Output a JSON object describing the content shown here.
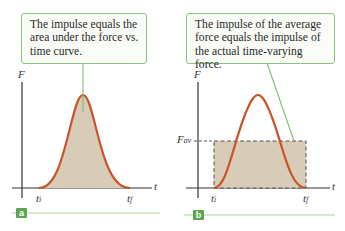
{
  "panels": [
    {
      "id": "a",
      "tag": "a",
      "callout": "The impulse equals the area under the force vs. time curve.",
      "y_axis_label": "F",
      "x_axis_label": "t",
      "t_initial_label": "t",
      "t_initial_sub": "i",
      "t_final_label": "t",
      "t_final_sub": "f"
    },
    {
      "id": "b",
      "tag": "b",
      "callout": "The impulse of the average force equals the impulse of the actual time-varying force.",
      "y_axis_label": "F",
      "x_axis_label": "t",
      "avg_label": "F",
      "avg_sub": "av",
      "t_initial_label": "t",
      "t_initial_sub": "i",
      "t_final_label": "t",
      "t_final_sub": "f"
    }
  ],
  "colors": {
    "curve": "#c8552a",
    "fill": "#d8cbb8",
    "callout_border": "#8cc47c",
    "tag_bg": "#5aa64e",
    "axis": "#333333"
  }
}
